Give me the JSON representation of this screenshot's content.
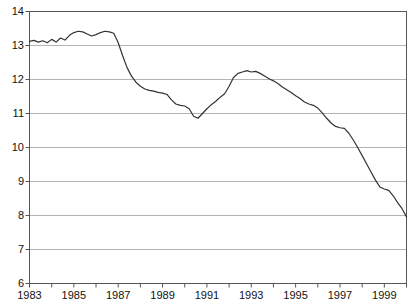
{
  "chart_data": {
    "type": "line",
    "title": "",
    "subtitle": "",
    "xlabel": "",
    "ylabel": "",
    "xlim": [
      1983,
      2000
    ],
    "ylim": [
      6,
      14
    ],
    "grid": true,
    "grid_axis": "y",
    "legend": false,
    "legend_position": "none",
    "line_color": "#333333",
    "grid_color": "#b4b4b4",
    "axis_color": "#555555",
    "background_color": "#ffffff",
    "y_ticks": [
      6,
      7,
      8,
      9,
      10,
      11,
      12,
      13,
      14
    ],
    "y_tick_labels": [
      "6",
      "7",
      "8",
      "9",
      "10",
      "11",
      "12",
      "13",
      "14"
    ],
    "x_ticks": [
      1983,
      1984,
      1985,
      1986,
      1987,
      1988,
      1989,
      1990,
      1991,
      1992,
      1993,
      1994,
      1995,
      1996,
      1997,
      1998,
      1999,
      2000
    ],
    "x_tick_labels": [
      "1983",
      "",
      "1985",
      "",
      "1987",
      "",
      "1989",
      "",
      "1991",
      "",
      "1993",
      "",
      "1995",
      "",
      "1997",
      "",
      "1999",
      ""
    ],
    "x_labeled_ticks": [
      1983,
      1985,
      1987,
      1989,
      1991,
      1993,
      1995,
      1997,
      1999
    ],
    "series": [
      {
        "name": "series-1",
        "x": [
          1983.0,
          1983.2,
          1983.4,
          1983.6,
          1983.8,
          1984.0,
          1984.2,
          1984.4,
          1984.6,
          1984.8,
          1985.0,
          1985.2,
          1985.4,
          1985.6,
          1985.8,
          1986.0,
          1986.2,
          1986.4,
          1986.6,
          1986.8,
          1987.0,
          1987.2,
          1987.4,
          1987.6,
          1987.8,
          1988.0,
          1988.2,
          1988.4,
          1988.6,
          1988.8,
          1989.0,
          1989.2,
          1989.4,
          1989.6,
          1989.8,
          1990.0,
          1990.2,
          1990.4,
          1990.6,
          1990.8,
          1991.0,
          1991.2,
          1991.4,
          1991.6,
          1991.8,
          1992.0,
          1992.2,
          1992.4,
          1992.6,
          1992.8,
          1993.0,
          1993.2,
          1993.4,
          1993.6,
          1993.8,
          1994.0,
          1994.2,
          1994.4,
          1994.6,
          1994.8,
          1995.0,
          1995.2,
          1995.4,
          1995.6,
          1995.8,
          1996.0,
          1996.2,
          1996.4,
          1996.6,
          1996.8,
          1997.0,
          1997.2,
          1997.4,
          1997.6,
          1997.8,
          1998.0,
          1998.2,
          1998.4,
          1998.6,
          1998.8,
          1999.0,
          1999.2,
          1999.4,
          1999.6,
          1999.8,
          2000.0
        ],
        "y": [
          13.12,
          13.15,
          13.1,
          13.14,
          13.08,
          13.18,
          13.1,
          13.22,
          13.16,
          13.3,
          13.38,
          13.42,
          13.4,
          13.34,
          13.28,
          13.32,
          13.38,
          13.42,
          13.4,
          13.36,
          13.08,
          12.7,
          12.35,
          12.1,
          11.92,
          11.8,
          11.72,
          11.68,
          11.66,
          11.62,
          11.6,
          11.56,
          11.4,
          11.28,
          11.24,
          11.22,
          11.14,
          10.92,
          10.86,
          11.0,
          11.14,
          11.26,
          11.36,
          11.48,
          11.58,
          11.8,
          12.06,
          12.18,
          12.22,
          12.26,
          12.22,
          12.24,
          12.18,
          12.1,
          12.02,
          11.96,
          11.88,
          11.78,
          11.7,
          11.62,
          11.52,
          11.44,
          11.34,
          11.28,
          11.24,
          11.16,
          11.02,
          10.86,
          10.72,
          10.62,
          10.58,
          10.56,
          10.42,
          10.22,
          10.0,
          9.76,
          9.52,
          9.28,
          9.04,
          8.84,
          8.78,
          8.74,
          8.58,
          8.38,
          8.2,
          7.96
        ]
      }
    ]
  }
}
